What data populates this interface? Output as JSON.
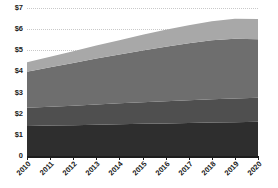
{
  "chart_data": {
    "type": "area",
    "title": "",
    "subtitle": "",
    "xlabel": "",
    "ylabel": "",
    "stacked": true,
    "grid": true,
    "legend": false,
    "legend_position": "none",
    "x": [
      2010,
      2011,
      2012,
      2013,
      2014,
      2015,
      2016,
      2017,
      2018,
      2019,
      2020
    ],
    "categories": [
      "2010",
      "2011",
      "2012",
      "2013",
      "2014",
      "2015",
      "2016",
      "2017",
      "2018",
      "2019",
      "2020"
    ],
    "xtick_labels": [
      "2010",
      "2011",
      "2012",
      "2013",
      "2014",
      "2015",
      "2016",
      "2017",
      "2018",
      "2019",
      "2020"
    ],
    "xtick_rotation": -45,
    "ylim": [
      0,
      7
    ],
    "ytick_values": [
      0,
      1,
      2,
      3,
      4,
      5,
      6,
      7
    ],
    "ytick_labels": [
      "0",
      "$1",
      "$2",
      "$3",
      "$4",
      "$5",
      "$6",
      "$7"
    ],
    "y_prefix": "$",
    "series": [
      {
        "name": "Series 1",
        "color": "#2e2e2e",
        "values": [
          1.42,
          1.44,
          1.46,
          1.48,
          1.5,
          1.52,
          1.54,
          1.56,
          1.58,
          1.6,
          1.62
        ]
      },
      {
        "name": "Series 2",
        "color": "#4f4f4f",
        "values": [
          0.86,
          0.89,
          0.92,
          0.96,
          0.99,
          1.02,
          1.05,
          1.08,
          1.11,
          1.12,
          1.14
        ]
      },
      {
        "name": "Series 3",
        "color": "#6e6e6e",
        "values": [
          1.71,
          1.87,
          2.02,
          2.17,
          2.31,
          2.45,
          2.58,
          2.69,
          2.78,
          2.83,
          2.76
        ]
      },
      {
        "name": "Series 4",
        "color": "#a8a8a8",
        "values": [
          0.44,
          0.5,
          0.56,
          0.62,
          0.68,
          0.74,
          0.8,
          0.86,
          0.9,
          0.94,
          0.96
        ]
      }
    ],
    "totals": [
      4.43,
      4.7,
      4.96,
      5.23,
      5.48,
      5.73,
      5.97,
      6.19,
      6.37,
      6.49,
      6.48
    ],
    "colors": {
      "band_1": "#2e2e2e",
      "band_2": "#4f4f4f",
      "band_3": "#6e6e6e",
      "band_4": "#a8a8a8",
      "grid": "#c9c9c9",
      "axis": "#1c1c1c",
      "background": "#ffffff",
      "text": "#1c1c1c"
    }
  }
}
